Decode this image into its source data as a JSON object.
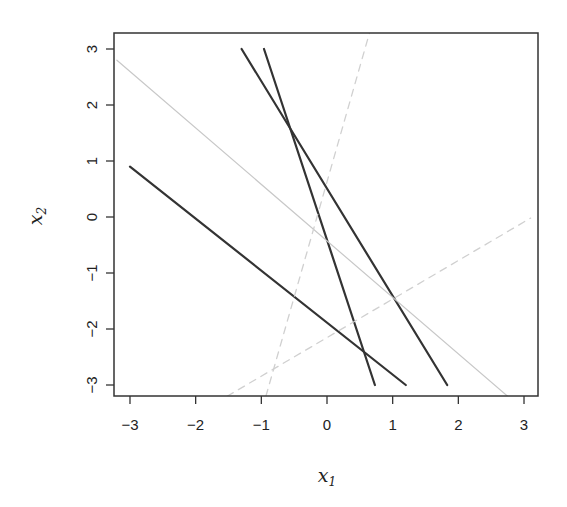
{
  "chart_data": {
    "type": "line",
    "title": "",
    "xlabel": "x1",
    "ylabel": "x2",
    "xlabel_base": "x",
    "xlabel_sub": "1",
    "ylabel_base": "x",
    "ylabel_sub": "2",
    "xlim": [
      -3.25,
      3.2
    ],
    "ylim": [
      -3.2,
      3.3
    ],
    "grid": false,
    "legend": null,
    "x_ticks": [
      -3,
      -2,
      -1,
      0,
      1,
      2,
      3
    ],
    "y_ticks": [
      -3,
      -2,
      -1,
      0,
      1,
      2,
      3
    ],
    "x_tick_labels": [
      "−3",
      "−2",
      "−1",
      "0",
      "1",
      "2",
      "3"
    ],
    "y_tick_labels": [
      "−3",
      "−2",
      "−1",
      "0",
      "1",
      "2",
      "3"
    ],
    "series": [
      {
        "name": "line-a",
        "style": "solid",
        "color": "#333333",
        "width": 2.2,
        "x": [
          -3.0,
          1.2
        ],
        "y": [
          0.9,
          -3.0
        ]
      },
      {
        "name": "line-b",
        "style": "solid",
        "color": "#333333",
        "width": 2.2,
        "x": [
          -1.3,
          1.83
        ],
        "y": [
          3.0,
          -3.0
        ]
      },
      {
        "name": "line-c",
        "style": "solid",
        "color": "#333333",
        "width": 2.2,
        "x": [
          -0.96,
          0.73
        ],
        "y": [
          3.0,
          -3.0
        ]
      },
      {
        "name": "gray-line",
        "style": "solid",
        "color": "#c8c8c8",
        "width": 1.2,
        "x": [
          -3.2,
          2.75
        ],
        "y": [
          2.8,
          -3.2
        ]
      },
      {
        "name": "dashed-steep",
        "style": "dashed",
        "color": "#d0d0d0",
        "width": 1.3,
        "x": [
          -0.93,
          0.65
        ],
        "y": [
          -3.2,
          3.3
        ]
      },
      {
        "name": "dashed-shallow",
        "style": "dashed",
        "color": "#d0d0d0",
        "width": 1.3,
        "x": [
          -1.52,
          3.1
        ],
        "y": [
          -3.2,
          -0.02
        ]
      }
    ]
  }
}
